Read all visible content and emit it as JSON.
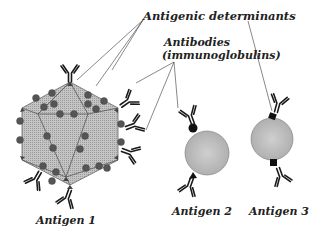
{
  "labels": {
    "antigenic_determinants": "Antigenic determinants",
    "antibodies_line1": "Antibodies",
    "antibodies_line2": "(immunoglobulins)",
    "antigen1": "Antigen 1",
    "antigen2": "Antigen 2",
    "antigen3": "Antigen 3"
  },
  "colors": {
    "antigen_fill": "#b8b8b8",
    "determinant_fill": "#555555",
    "antibody_stroke": "#1a1a1a",
    "leader_line": "#555555",
    "text": "#222222"
  }
}
